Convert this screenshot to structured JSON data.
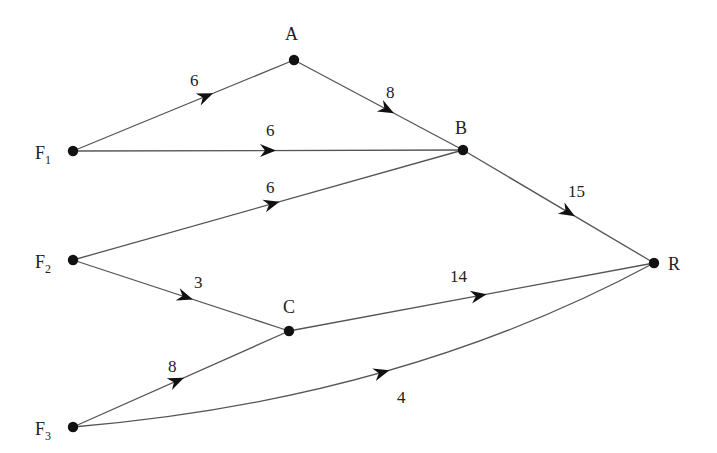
{
  "diagram": {
    "type": "directed-network",
    "nodes": [
      {
        "id": "F1",
        "label": "F",
        "subscript": "1"
      },
      {
        "id": "A",
        "label": "A",
        "subscript": ""
      },
      {
        "id": "B",
        "label": "B",
        "subscript": ""
      },
      {
        "id": "F2",
        "label": "F",
        "subscript": "2"
      },
      {
        "id": "C",
        "label": "C",
        "subscript": ""
      },
      {
        "id": "R",
        "label": "R",
        "subscript": ""
      },
      {
        "id": "F3",
        "label": "F",
        "subscript": "3"
      }
    ],
    "edges": [
      {
        "from": "F1",
        "to": "A",
        "weight": "6"
      },
      {
        "from": "A",
        "to": "B",
        "weight": "8"
      },
      {
        "from": "F1",
        "to": "B",
        "weight": "6"
      },
      {
        "from": "F2",
        "to": "B",
        "weight": "6"
      },
      {
        "from": "B",
        "to": "R",
        "weight": "15"
      },
      {
        "from": "F2",
        "to": "C",
        "weight": "3"
      },
      {
        "from": "C",
        "to": "R",
        "weight": "14"
      },
      {
        "from": "F3",
        "to": "C",
        "weight": "8"
      },
      {
        "from": "F3",
        "to": "R",
        "weight": "4"
      }
    ]
  }
}
